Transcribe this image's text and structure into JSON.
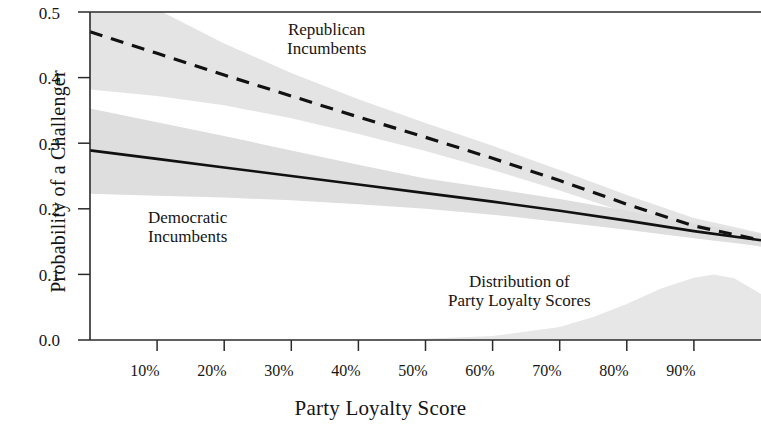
{
  "figure": {
    "background": "#ffffff",
    "ink_color": "#141414",
    "band_color": "#e3e3e3",
    "band_color_dark": "#dcdcdc",
    "dist_color": "#e8e8e8"
  },
  "axes": {
    "ylabel": "Probability of a Challenger",
    "xlabel": "Party Loyalty Score",
    "yticks": [
      "0.5",
      "0.4",
      "0.3",
      "0.2",
      "0.1",
      "0.0"
    ],
    "xticks": [
      "10%",
      "20%",
      "30%",
      "40%",
      "50%",
      "60%",
      "70%",
      "80%",
      "90%"
    ]
  },
  "annotations": {
    "republican": {
      "line1": "Republican",
      "line2": "Incumbents"
    },
    "democratic": {
      "line1": "Democratic",
      "line2": "Incumbents"
    },
    "distribution": {
      "line1": "Distribution of",
      "line2": "Party Loyalty Scores"
    }
  },
  "chart_data": {
    "type": "line",
    "title": "",
    "xlabel": "Party Loyalty Score",
    "ylabel": "Probability of a Challenger",
    "xlim": [
      0,
      100
    ],
    "ylim": [
      0.0,
      0.5
    ],
    "xtick_values": [
      10,
      20,
      30,
      40,
      50,
      60,
      70,
      80,
      90
    ],
    "xtick_labels": [
      "10%",
      "20%",
      "30%",
      "40%",
      "50%",
      "60%",
      "70%",
      "80%",
      "90%"
    ],
    "ytick_values": [
      0.0,
      0.1,
      0.2,
      0.3,
      0.4,
      0.5
    ],
    "ytick_labels": [
      "0.0",
      "0.1",
      "0.2",
      "0.3",
      "0.4",
      "0.5"
    ],
    "grid": false,
    "legend": "inline annotations",
    "x": [
      0,
      10,
      20,
      30,
      40,
      50,
      60,
      70,
      80,
      90,
      100
    ],
    "series": [
      {
        "name": "Republican Incumbents",
        "style": "dashed",
        "values": [
          0.47,
          0.437,
          0.404,
          0.372,
          0.34,
          0.309,
          0.277,
          0.243,
          0.207,
          0.174,
          0.152
        ],
        "ci_lower": [
          0.382,
          0.372,
          0.358,
          0.338,
          0.314,
          0.288,
          0.259,
          0.228,
          0.194,
          0.163,
          0.142
        ],
        "ci_upper": [
          0.556,
          0.504,
          0.452,
          0.407,
          0.367,
          0.331,
          0.296,
          0.259,
          0.221,
          0.186,
          0.163
        ]
      },
      {
        "name": "Democratic Incumbents",
        "style": "solid",
        "values": [
          0.289,
          0.276,
          0.263,
          0.25,
          0.237,
          0.224,
          0.211,
          0.197,
          0.182,
          0.166,
          0.152
        ],
        "ci_lower": [
          0.223,
          0.22,
          0.217,
          0.213,
          0.207,
          0.2,
          0.191,
          0.18,
          0.168,
          0.155,
          0.143
        ],
        "ci_upper": [
          0.353,
          0.332,
          0.311,
          0.289,
          0.267,
          0.246,
          0.231,
          0.215,
          0.197,
          0.178,
          0.162
        ]
      }
    ],
    "distribution": {
      "name": "Distribution of Party Loyalty Scores",
      "style": "filled density",
      "x": [
        0,
        10,
        20,
        30,
        40,
        50,
        60,
        70,
        75,
        80,
        85,
        90,
        93,
        96,
        100
      ],
      "density": [
        0.0,
        0.0,
        0.0,
        0.0,
        0.0,
        0.002,
        0.006,
        0.02,
        0.035,
        0.055,
        0.078,
        0.095,
        0.1,
        0.094,
        0.07
      ]
    }
  }
}
